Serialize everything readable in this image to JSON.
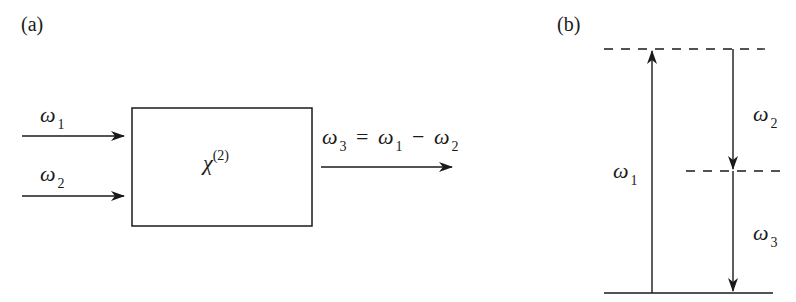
{
  "panel_a": {
    "label": "(a)",
    "inputs": [
      {
        "symbol": "ω",
        "subscript": "1"
      },
      {
        "symbol": "ω",
        "subscript": "2"
      }
    ],
    "box": {
      "symbol": "χ",
      "superscript": "(2)"
    },
    "output": {
      "lhs": {
        "symbol": "ω",
        "subscript": "3"
      },
      "equals": "=",
      "term1": {
        "symbol": "ω",
        "subscript": "1"
      },
      "minus": "−",
      "term2": {
        "symbol": "ω",
        "subscript": "2"
      }
    }
  },
  "panel_b": {
    "label": "(b)",
    "up_arrow": {
      "symbol": "ω",
      "subscript": "1"
    },
    "down_arrow_upper": {
      "symbol": "ω",
      "subscript": "2"
    },
    "down_arrow_lower": {
      "symbol": "ω",
      "subscript": "3"
    }
  },
  "colors": {
    "stroke": "#1a1a1a",
    "background": "#ffffff"
  }
}
